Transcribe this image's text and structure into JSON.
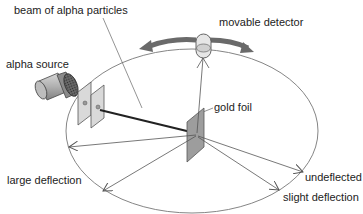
{
  "diagram": {
    "labels": {
      "beam": "beam of alpha particles",
      "detector": "movable detector",
      "source": "alpha source",
      "foil": "gold foil",
      "large": "large deflection",
      "undeflected": "undeflected",
      "slight": "slight deflection"
    },
    "components": [
      "alpha source",
      "collimator slits",
      "beam of alpha particles",
      "gold foil",
      "circular detection screen",
      "movable detector"
    ],
    "colors": {
      "line": "#555555",
      "beam": "#222222",
      "foil": "#9a9a9a",
      "motion_arrow": "#666666",
      "text": "#222222"
    }
  }
}
